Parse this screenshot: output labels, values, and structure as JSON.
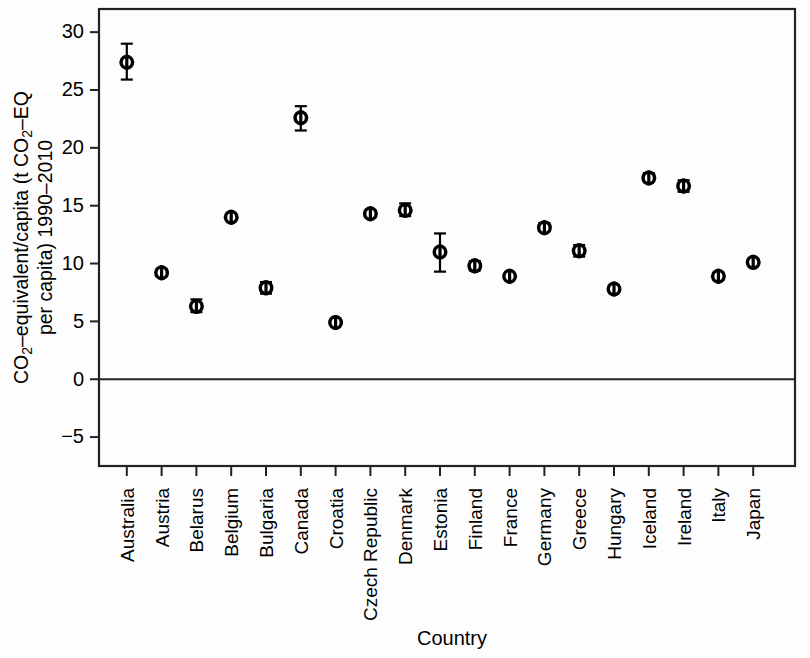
{
  "chart_data": {
    "type": "scatter",
    "title": "",
    "xlabel": "Country",
    "ylabel_line1_pre": "CO",
    "ylabel_line1_sub": "2",
    "ylabel_line1_post": "–equivalent/capita (t CO",
    "ylabel_line1_sub2": "2",
    "ylabel_line1_tail": "–EQ",
    "ylabel_line2": "per capita) 1990–2010",
    "ylabel_full": "CO2–equivalent/capita (t CO2–EQ per capita) 1990–2010",
    "ylim": [
      -7.5,
      32.0
    ],
    "yticks": [
      30,
      25,
      20,
      15,
      10,
      5,
      0,
      -5
    ],
    "ytick_labels": [
      "30",
      "25",
      "20",
      "15",
      "10",
      "5",
      "0",
      "−5"
    ],
    "grid": false,
    "legend": "none",
    "zero_reference_line": 0,
    "marker_style": "open-circle-black-outline",
    "error_bar_type": "range",
    "categories": [
      "Australia",
      "Austria",
      "Belarus",
      "Belgium",
      "Bulgaria",
      "Canada",
      "Croatia",
      "Czech Republic",
      "Denmark",
      "Estonia",
      "Finland",
      "France",
      "Germany",
      "Greece",
      "Hungary",
      "Iceland",
      "Ireland",
      "Italy",
      "Japan"
    ],
    "values": [
      27.4,
      9.2,
      6.3,
      14.0,
      7.9,
      22.6,
      4.9,
      14.3,
      14.6,
      11.0,
      9.8,
      8.9,
      13.1,
      11.1,
      7.8,
      17.4,
      16.7,
      8.9,
      10.1
    ],
    "err_low": [
      25.9,
      8.9,
      5.8,
      13.8,
      7.4,
      21.5,
      4.7,
      14.0,
      14.1,
      9.3,
      9.4,
      8.7,
      12.8,
      10.6,
      7.5,
      17.1,
      16.2,
      8.6,
      9.8
    ],
    "err_high": [
      29.0,
      9.5,
      6.9,
      14.2,
      8.4,
      23.6,
      5.1,
      14.6,
      15.2,
      12.6,
      10.2,
      9.1,
      13.5,
      11.6,
      8.1,
      17.8,
      17.2,
      9.2,
      10.4
    ],
    "series": [
      {
        "name": "CO2-equivalent per capita",
        "points": [
          {
            "country": "Australia",
            "value": 27.4,
            "low": 25.9,
            "high": 29.0
          },
          {
            "country": "Austria",
            "value": 9.2,
            "low": 8.9,
            "high": 9.5
          },
          {
            "country": "Belarus",
            "value": 6.3,
            "low": 5.8,
            "high": 6.9
          },
          {
            "country": "Belgium",
            "value": 14.0,
            "low": 13.8,
            "high": 14.2
          },
          {
            "country": "Bulgaria",
            "value": 7.9,
            "low": 7.4,
            "high": 8.4
          },
          {
            "country": "Canada",
            "value": 22.6,
            "low": 21.5,
            "high": 23.6
          },
          {
            "country": "Croatia",
            "value": 4.9,
            "low": 4.7,
            "high": 5.1
          },
          {
            "country": "Czech Republic",
            "value": 14.3,
            "low": 14.0,
            "high": 14.6
          },
          {
            "country": "Denmark",
            "value": 14.6,
            "low": 14.1,
            "high": 15.2
          },
          {
            "country": "Estonia",
            "value": 11.0,
            "low": 9.3,
            "high": 12.6
          },
          {
            "country": "Finland",
            "value": 9.8,
            "low": 9.4,
            "high": 10.2
          },
          {
            "country": "France",
            "value": 8.9,
            "low": 8.7,
            "high": 9.1
          },
          {
            "country": "Germany",
            "value": 13.1,
            "low": 12.8,
            "high": 13.5
          },
          {
            "country": "Greece",
            "value": 11.1,
            "low": 10.6,
            "high": 11.6
          },
          {
            "country": "Hungary",
            "value": 7.8,
            "low": 7.5,
            "high": 8.1
          },
          {
            "country": "Iceland",
            "value": 17.4,
            "low": 17.1,
            "high": 17.8
          },
          {
            "country": "Ireland",
            "value": 16.7,
            "low": 16.2,
            "high": 17.2
          },
          {
            "country": "Italy",
            "value": 8.9,
            "low": 8.6,
            "high": 9.2
          },
          {
            "country": "Japan",
            "value": 10.1,
            "low": 9.8,
            "high": 10.4
          }
        ]
      }
    ]
  }
}
